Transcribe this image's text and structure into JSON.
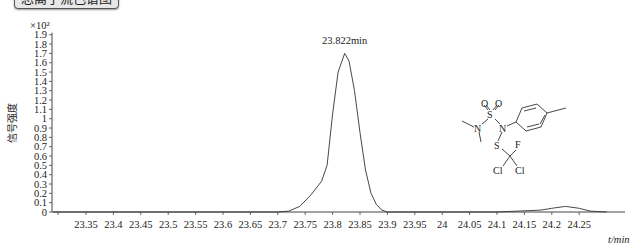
{
  "title": "总离子流色谱图",
  "chart_data": {
    "type": "line",
    "title": "总离子流色谱图",
    "xlabel": "t/min",
    "ylabel": "信号强度",
    "y_multiplier": "×10²",
    "xlim": [
      23.29,
      24.3
    ],
    "ylim": [
      0,
      1.9
    ],
    "x_ticks": [
      "23.35",
      "23.4",
      "23.45",
      "23.5",
      "23.55",
      "23.6",
      "23.65",
      "23.7",
      "23.75",
      "23.8",
      "23.85",
      "23.9",
      "23.95",
      "24",
      "24.05",
      "24.1",
      "24.15",
      "24.2",
      "24.25"
    ],
    "y_ticks": [
      "0",
      "0.1",
      "0.2",
      "0.3",
      "0.4",
      "0.5",
      "0.6",
      "0.7",
      "0.8",
      "0.9",
      "1",
      "1.1",
      "1.2",
      "1.3",
      "1.4",
      "1.5",
      "1.6",
      "1.7",
      "1.8",
      "1.9"
    ],
    "grid": false,
    "annotations": [
      {
        "text": "23.822min",
        "x": 23.822,
        "y": 1.7
      }
    ],
    "series": [
      {
        "name": "TIC",
        "x": [
          23.29,
          23.7,
          23.72,
          23.74,
          23.76,
          23.78,
          23.79,
          23.8,
          23.81,
          23.822,
          23.83,
          23.84,
          23.85,
          23.86,
          23.87,
          23.88,
          23.89,
          23.9,
          23.95,
          24.1,
          24.18,
          24.2,
          24.225,
          24.25,
          24.27,
          24.3
        ],
        "values": [
          0.0,
          0.0,
          0.01,
          0.06,
          0.18,
          0.33,
          0.5,
          1.05,
          1.5,
          1.7,
          1.62,
          1.3,
          0.85,
          0.45,
          0.2,
          0.08,
          0.02,
          0.0,
          0.0,
          0.0,
          0.02,
          0.04,
          0.06,
          0.04,
          0.01,
          0.0
        ]
      }
    ]
  },
  "structure": {
    "name": "dichlofluanid-like sulfamide (tolylfluanid)",
    "atoms": [
      "O",
      "O",
      "S",
      "N",
      "N",
      "S",
      "F",
      "Cl",
      "Cl"
    ]
  }
}
